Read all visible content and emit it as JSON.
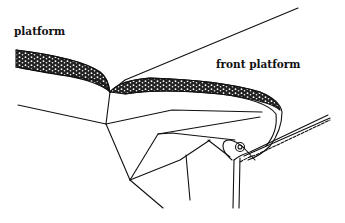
{
  "figure": {
    "labels": {
      "platform": "platform",
      "front_platform": "front platform"
    },
    "colors": {
      "ink": "#111111",
      "background": "#ffffff"
    }
  }
}
